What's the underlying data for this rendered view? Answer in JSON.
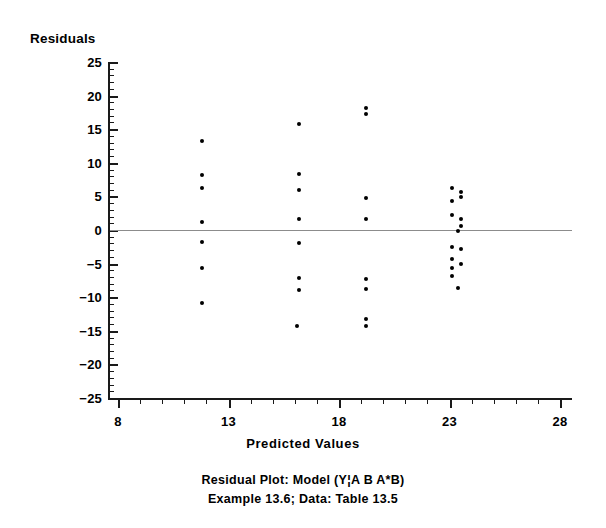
{
  "figure": {
    "ylabel": "Residuals",
    "xlabel": "Predicted Values",
    "caption_line1": "Residual Plot: Model (Y¦A  B  A*B)",
    "caption_line2": "Example 13.6; Data: Table 13.5"
  },
  "chart_data": {
    "type": "scatter",
    "title": "Residual Plot: Model (Y¦A  B  A*B)",
    "subtitle": "Example 13.6; Data: Table 13.5",
    "xlabel": "Predicted Values",
    "ylabel": "Residuals",
    "xlim": [
      8,
      28
    ],
    "ylim": [
      -25,
      25
    ],
    "xticks": [
      8,
      13,
      18,
      23,
      28
    ],
    "yticks": [
      25,
      20,
      15,
      10,
      5,
      0,
      -5,
      -10,
      -15,
      -20,
      -25
    ],
    "xtick_labels": [
      "8",
      "13",
      "18",
      "23",
      "28"
    ],
    "ytick_labels": [
      "25",
      "20",
      "15",
      "10",
      "5",
      "0",
      "−5",
      "−10",
      "−15",
      "−20",
      "−25"
    ],
    "x_minor_tick_step": 1,
    "y_minor_tick_step": 1,
    "grid": false,
    "legend": false,
    "reference_line": {
      "y": 0,
      "color": "#8c8c8c"
    },
    "marker": {
      "shape": "circle",
      "color": "#000000",
      "size": 4
    },
    "points": [
      {
        "x": 11.8,
        "y": 13.2
      },
      {
        "x": 11.8,
        "y": 8.2
      },
      {
        "x": 11.8,
        "y": 6.2
      },
      {
        "x": 11.8,
        "y": 1.2
      },
      {
        "x": 11.8,
        "y": -1.8
      },
      {
        "x": 11.8,
        "y": -5.7
      },
      {
        "x": 11.8,
        "y": -10.8
      },
      {
        "x": 16.2,
        "y": 15.8
      },
      {
        "x": 16.2,
        "y": 8.3
      },
      {
        "x": 16.2,
        "y": 6.0
      },
      {
        "x": 16.2,
        "y": 1.6
      },
      {
        "x": 16.2,
        "y": -2.0
      },
      {
        "x": 16.2,
        "y": -7.1
      },
      {
        "x": 16.2,
        "y": -9.0
      },
      {
        "x": 16.1,
        "y": -14.3
      },
      {
        "x": 19.2,
        "y": 18.2
      },
      {
        "x": 19.2,
        "y": 17.2
      },
      {
        "x": 19.2,
        "y": 4.7
      },
      {
        "x": 19.2,
        "y": 1.7
      },
      {
        "x": 19.2,
        "y": -7.3
      },
      {
        "x": 19.2,
        "y": -8.8
      },
      {
        "x": 19.2,
        "y": -13.2
      },
      {
        "x": 19.2,
        "y": -14.3
      },
      {
        "x": 23.1,
        "y": 6.3
      },
      {
        "x": 23.5,
        "y": 5.6
      },
      {
        "x": 23.1,
        "y": 4.3
      },
      {
        "x": 23.5,
        "y": 4.9
      },
      {
        "x": 23.1,
        "y": 2.2
      },
      {
        "x": 23.5,
        "y": 1.7
      },
      {
        "x": 23.5,
        "y": 0.6
      },
      {
        "x": 23.4,
        "y": -0.1
      },
      {
        "x": 23.1,
        "y": -2.6
      },
      {
        "x": 23.5,
        "y": -2.9
      },
      {
        "x": 23.1,
        "y": -4.3
      },
      {
        "x": 23.1,
        "y": -5.6
      },
      {
        "x": 23.5,
        "y": -5.1
      },
      {
        "x": 23.1,
        "y": -6.8
      },
      {
        "x": 23.4,
        "y": -8.7
      }
    ]
  }
}
